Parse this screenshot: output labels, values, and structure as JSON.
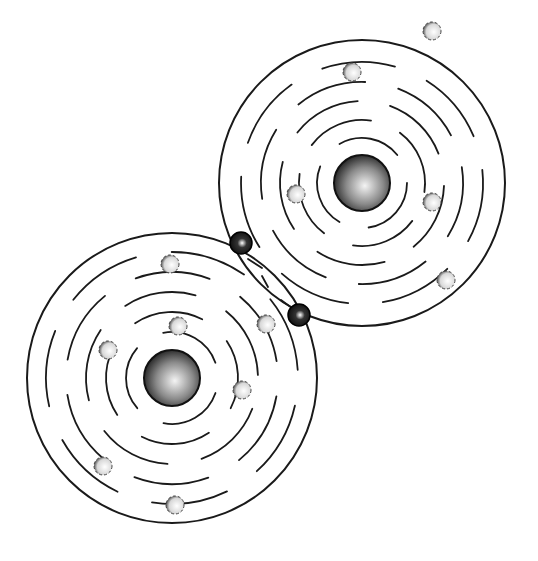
{
  "diagram": {
    "type": "covalent-bond-illustration",
    "colors": {
      "line": "#1a1a1a",
      "background": "#ffffff",
      "shared_electron": "#111111",
      "electron": "#ffffff"
    },
    "atoms": [
      {
        "name": "upper-right-atom",
        "cx": 362,
        "cy": 183,
        "nucleus_r": 28,
        "outer_r": 143,
        "dashed_radii": [
          45,
          63,
          82,
          101,
          121
        ],
        "electrons": [
          [
            432,
            31
          ],
          [
            296,
            194
          ],
          [
            432,
            202
          ],
          [
            446,
            280
          ],
          [
            352,
            72
          ]
        ]
      },
      {
        "name": "lower-left-atom",
        "cx": 172,
        "cy": 378,
        "nucleus_r": 28,
        "outer_r": 145,
        "dashed_radii": [
          46,
          66,
          86,
          106,
          126
        ],
        "electrons": [
          [
            170,
            264
          ],
          [
            178,
            326
          ],
          [
            108,
            350
          ],
          [
            242,
            390
          ],
          [
            103,
            466
          ],
          [
            175,
            505
          ],
          [
            266,
            324
          ]
        ]
      }
    ],
    "shared_electrons": [
      [
        241,
        243
      ],
      [
        299,
        315
      ]
    ]
  }
}
